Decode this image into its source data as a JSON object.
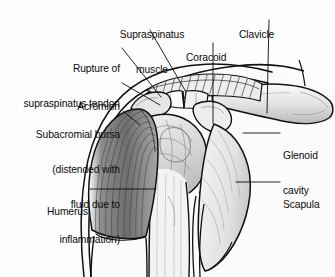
{
  "figure": {
    "view": "anterior coronal section of right shoulder",
    "style": "grayscale pen-and-ink medical line art",
    "background_color": "#fdfdfd",
    "line_color": "#111111",
    "shading_colors": [
      "#ffffff",
      "#e9e9e9",
      "#cfcfcf",
      "#a8a8a8",
      "#7c7c7c",
      "#555555"
    ]
  },
  "labels": [
    {
      "id": "supraspinatus-muscle",
      "lines": [
        "Supraspinatus",
        "muscle"
      ],
      "text": "Supraspinatus muscle",
      "align": "center",
      "x": 104,
      "y": 6,
      "width": 96
    },
    {
      "id": "clavicle",
      "lines": [
        "Clavicle"
      ],
      "text": "Clavicle",
      "align": "left",
      "x": 239,
      "y": 6,
      "width": 60
    },
    {
      "id": "coracoid",
      "lines": [
        "Coracoid"
      ],
      "text": "Coracoid",
      "align": "left",
      "x": 186,
      "y": 29,
      "width": 62
    },
    {
      "id": "rupture-of-supraspinatus-tendon",
      "lines": [
        "Rupture of",
        "supraspinatus tendon"
      ],
      "text": "Rupture of supraspinatus tendon",
      "align": "right",
      "x": 6,
      "y": 40,
      "width": 114
    },
    {
      "id": "acromion",
      "lines": [
        "Acromion"
      ],
      "text": "Acromion",
      "align": "right",
      "x": 40,
      "y": 78,
      "width": 80
    },
    {
      "id": "subacromial-bursa",
      "lines": [
        "Subacromial bursa",
        "(distended with",
        "fluid due to",
        "inflammation)"
      ],
      "text": "Subacromial bursa (distended with fluid due to inflammation)",
      "align": "right",
      "x": 8,
      "y": 106,
      "width": 112
    },
    {
      "id": "glenoid-cavity",
      "lines": [
        "Glenoid",
        "cavity"
      ],
      "text": "Glenoid cavity",
      "align": "left",
      "x": 283,
      "y": 127,
      "width": 52
    },
    {
      "id": "humerus",
      "lines": [
        "Humerus"
      ],
      "text": "Humerus",
      "align": "right",
      "x": 20,
      "y": 183,
      "width": 68
    },
    {
      "id": "scapula",
      "lines": [
        "Scapula"
      ],
      "text": "Scapula",
      "align": "left",
      "x": 283,
      "y": 176,
      "width": 52
    }
  ],
  "leader_lines": [
    {
      "id": "leader-supraspinatus-muscle",
      "from": [
        150,
        30
      ],
      "to": [
        186,
        92
      ]
    },
    {
      "id": "leader-clavicle",
      "from": [
        269,
        20
      ],
      "to": [
        267,
        113
      ]
    },
    {
      "id": "leader-coracoid",
      "from": [
        213,
        43
      ],
      "to": [
        213,
        123
      ]
    },
    {
      "id": "leader-rupture",
      "from": [
        122,
        48
      ],
      "to": [
        160,
        96
      ]
    },
    {
      "id": "leader-acromion",
      "from": [
        122,
        83
      ],
      "to": [
        160,
        104
      ]
    },
    {
      "id": "leader-subacromial-bursa",
      "from": [
        123,
        111
      ],
      "to": [
        139,
        124
      ]
    },
    {
      "id": "leader-glenoid-cavity",
      "from": [
        280,
        133
      ],
      "to": [
        243,
        133
      ]
    },
    {
      "id": "leader-humerus",
      "from": [
        90,
        189
      ],
      "to": [
        156,
        189
      ]
    },
    {
      "id": "leader-scapula",
      "from": [
        280,
        182
      ],
      "to": [
        236,
        182
      ]
    }
  ]
}
